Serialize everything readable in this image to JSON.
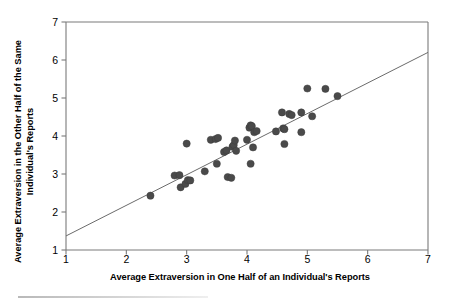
{
  "chart_data": {
    "type": "scatter",
    "title": "",
    "xlabel": "Average Extraversion in One Half of an Individual's Reports",
    "ylabel": "Average Extraversion in the Other Half of the Same Individual's Reports",
    "xlim": [
      1,
      7
    ],
    "ylim": [
      1,
      7
    ],
    "xticks": [
      1,
      2,
      3,
      4,
      5,
      6,
      7
    ],
    "yticks": [
      1,
      2,
      3,
      4,
      5,
      6,
      7
    ],
    "xtick_labels": [
      "1",
      "2",
      "3",
      "4",
      "5",
      "6",
      "7"
    ],
    "ytick_labels": [
      "1",
      "2",
      "3",
      "4",
      "5",
      "6",
      "7"
    ],
    "grid": false,
    "legend": null,
    "marker": {
      "shape": "circle",
      "color": "#4a4a4a",
      "size_px": 7.2,
      "edge_color": "#3c3c3c"
    },
    "trendline": {
      "type": "linear",
      "color": "#6b6b6b",
      "width_px": 1,
      "x_start": 1.0,
      "y_start": 1.37,
      "x_end": 7.0,
      "y_end": 6.2
    },
    "points": [
      [
        2.4,
        2.43
      ],
      [
        2.8,
        2.96
      ],
      [
        2.88,
        2.97
      ],
      [
        2.9,
        2.65
      ],
      [
        2.98,
        2.74
      ],
      [
        3.0,
        3.8
      ],
      [
        3.02,
        2.84
      ],
      [
        3.06,
        2.83
      ],
      [
        3.3,
        3.07
      ],
      [
        3.4,
        3.9
      ],
      [
        3.48,
        3.92
      ],
      [
        3.52,
        3.95
      ],
      [
        3.5,
        3.27
      ],
      [
        3.62,
        3.58
      ],
      [
        3.66,
        3.62
      ],
      [
        3.68,
        2.92
      ],
      [
        3.74,
        2.9
      ],
      [
        3.76,
        3.72
      ],
      [
        3.78,
        3.76
      ],
      [
        3.8,
        3.88
      ],
      [
        3.82,
        3.61
      ],
      [
        4.0,
        3.9
      ],
      [
        4.04,
        4.22
      ],
      [
        4.06,
        4.28
      ],
      [
        4.08,
        4.26
      ],
      [
        4.06,
        3.27
      ],
      [
        4.1,
        3.7
      ],
      [
        4.12,
        4.1
      ],
      [
        4.16,
        4.13
      ],
      [
        4.48,
        4.12
      ],
      [
        4.58,
        4.62
      ],
      [
        4.6,
        4.2
      ],
      [
        4.62,
        4.18
      ],
      [
        4.62,
        3.79
      ],
      [
        4.7,
        4.58
      ],
      [
        4.74,
        4.55
      ],
      [
        4.9,
        4.62
      ],
      [
        4.9,
        4.1
      ],
      [
        5.0,
        5.25
      ],
      [
        5.08,
        4.52
      ],
      [
        5.3,
        5.24
      ],
      [
        5.5,
        5.05
      ]
    ]
  },
  "axes": {
    "frame_color": "#7a7a7a",
    "tick_color": "#7a7a7a",
    "background": "#ffffff"
  }
}
